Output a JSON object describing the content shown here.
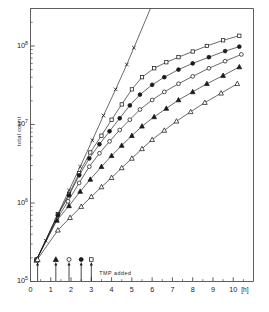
{
  "chart_data": {
    "type": "line",
    "title": "",
    "xlabel": "[h]",
    "ylabel": "total count",
    "yscale": "log",
    "ylim": [
      100000,
      300000000
    ],
    "xlim": [
      0,
      11
    ],
    "xticks": [
      "0",
      "1",
      "2",
      "3",
      "4",
      "5",
      "6",
      "7",
      "8",
      "9",
      "10"
    ],
    "xtick_values": [
      0,
      1,
      2,
      3,
      4,
      5,
      6,
      7,
      8,
      9,
      10
    ],
    "yticks": [
      "10",
      "10",
      "10",
      "10"
    ],
    "ytick_exponents": [
      "5",
      "6",
      "7",
      "8"
    ],
    "ytick_values": [
      100000,
      1000000,
      10000000,
      100000000
    ],
    "grid": false,
    "legend_position": "none",
    "annotation": "TMP added",
    "series": [
      {
        "name": "control",
        "marker": "cross",
        "filled": false,
        "tmp_time": null,
        "points": [
          {
            "x": 0.3,
            "y": 190000
          },
          {
            "x": 0.75,
            "y": 330000
          },
          {
            "x": 1.35,
            "y": 720000
          },
          {
            "x": 1.9,
            "y": 1450000
          },
          {
            "x": 2.45,
            "y": 2900000
          },
          {
            "x": 3.05,
            "y": 6300000
          },
          {
            "x": 3.6,
            "y": 13000000
          },
          {
            "x": 4.2,
            "y": 28000000
          },
          {
            "x": 4.75,
            "y": 58000000
          },
          {
            "x": 5.1,
            "y": 95000000
          }
        ]
      },
      {
        "name": "TMP added at 3.0 h",
        "marker": "square",
        "filled": false,
        "tmp_time": 3.0,
        "points": [
          {
            "x": 0.3,
            "y": 190000
          },
          {
            "x": 1.35,
            "y": 720000
          },
          {
            "x": 1.9,
            "y": 1300000
          },
          {
            "x": 2.4,
            "y": 2400000
          },
          {
            "x": 2.95,
            "y": 4400000
          },
          {
            "x": 3.5,
            "y": 7200000
          },
          {
            "x": 4.0,
            "y": 11500000
          },
          {
            "x": 4.5,
            "y": 18000000
          },
          {
            "x": 5.0,
            "y": 28000000
          },
          {
            "x": 5.5,
            "y": 40000000
          },
          {
            "x": 6.1,
            "y": 52000000
          },
          {
            "x": 6.7,
            "y": 62000000
          },
          {
            "x": 7.3,
            "y": 72000000
          },
          {
            "x": 8.0,
            "y": 85000000
          },
          {
            "x": 8.7,
            "y": 100000000
          },
          {
            "x": 9.5,
            "y": 118000000
          },
          {
            "x": 10.3,
            "y": 135000000
          }
        ]
      },
      {
        "name": "TMP added at 2.5 h",
        "marker": "circle",
        "filled": true,
        "tmp_time": 2.5,
        "points": [
          {
            "x": 0.3,
            "y": 190000
          },
          {
            "x": 1.35,
            "y": 700000
          },
          {
            "x": 1.9,
            "y": 1250000
          },
          {
            "x": 2.4,
            "y": 2250000
          },
          {
            "x": 2.9,
            "y": 3700000
          },
          {
            "x": 3.4,
            "y": 5600000
          },
          {
            "x": 3.9,
            "y": 8200000
          },
          {
            "x": 4.4,
            "y": 12000000
          },
          {
            "x": 4.9,
            "y": 17500000
          },
          {
            "x": 5.4,
            "y": 24000000
          },
          {
            "x": 6.0,
            "y": 32000000
          },
          {
            "x": 6.6,
            "y": 40000000
          },
          {
            "x": 7.3,
            "y": 50000000
          },
          {
            "x": 8.0,
            "y": 60000000
          },
          {
            "x": 8.8,
            "y": 72000000
          },
          {
            "x": 9.6,
            "y": 86000000
          },
          {
            "x": 10.3,
            "y": 98000000
          }
        ]
      },
      {
        "name": "TMP added at 1.9 h",
        "marker": "circle",
        "filled": false,
        "tmp_time": 1.9,
        "points": [
          {
            "x": 0.3,
            "y": 190000
          },
          {
            "x": 1.3,
            "y": 620000
          },
          {
            "x": 1.85,
            "y": 1050000
          },
          {
            "x": 2.4,
            "y": 1800000
          },
          {
            "x": 2.9,
            "y": 2900000
          },
          {
            "x": 3.4,
            "y": 4300000
          },
          {
            "x": 3.9,
            "y": 6100000
          },
          {
            "x": 4.4,
            "y": 8500000
          },
          {
            "x": 4.9,
            "y": 11500000
          },
          {
            "x": 5.4,
            "y": 15500000
          },
          {
            "x": 6.0,
            "y": 20500000
          },
          {
            "x": 6.6,
            "y": 26000000
          },
          {
            "x": 7.3,
            "y": 33000000
          },
          {
            "x": 8.0,
            "y": 41000000
          },
          {
            "x": 8.8,
            "y": 52000000
          },
          {
            "x": 9.6,
            "y": 64000000
          },
          {
            "x": 10.4,
            "y": 78000000
          }
        ]
      },
      {
        "name": "TMP added at 1.25 h",
        "marker": "triangle",
        "filled": true,
        "tmp_time": 1.25,
        "points": [
          {
            "x": 0.3,
            "y": 190000
          },
          {
            "x": 1.3,
            "y": 600000
          },
          {
            "x": 1.9,
            "y": 920000
          },
          {
            "x": 2.45,
            "y": 1400000
          },
          {
            "x": 2.95,
            "y": 2000000
          },
          {
            "x": 3.5,
            "y": 2900000
          },
          {
            "x": 4.0,
            "y": 4000000
          },
          {
            "x": 4.5,
            "y": 5400000
          },
          {
            "x": 5.0,
            "y": 7200000
          },
          {
            "x": 5.5,
            "y": 9500000
          },
          {
            "x": 6.1,
            "y": 12500000
          },
          {
            "x": 6.7,
            "y": 16000000
          },
          {
            "x": 7.3,
            "y": 20500000
          },
          {
            "x": 8.0,
            "y": 26000000
          },
          {
            "x": 8.7,
            "y": 33000000
          },
          {
            "x": 9.5,
            "y": 42000000
          },
          {
            "x": 10.3,
            "y": 54000000
          }
        ]
      },
      {
        "name": "TMP added at 0.35 h",
        "marker": "triangle",
        "filled": false,
        "tmp_time": 0.35,
        "points": [
          {
            "x": 0.3,
            "y": 185000
          },
          {
            "x": 1.35,
            "y": 450000
          },
          {
            "x": 1.95,
            "y": 650000
          },
          {
            "x": 2.5,
            "y": 900000
          },
          {
            "x": 3.0,
            "y": 1200000
          },
          {
            "x": 3.5,
            "y": 1600000
          },
          {
            "x": 4.0,
            "y": 2100000
          },
          {
            "x": 4.5,
            "y": 2800000
          },
          {
            "x": 5.0,
            "y": 3700000
          },
          {
            "x": 5.5,
            "y": 4900000
          },
          {
            "x": 6.0,
            "y": 6400000
          },
          {
            "x": 6.6,
            "y": 8400000
          },
          {
            "x": 7.2,
            "y": 11000000
          },
          {
            "x": 7.9,
            "y": 14500000
          },
          {
            "x": 8.6,
            "y": 19000000
          },
          {
            "x": 9.4,
            "y": 25000000
          },
          {
            "x": 10.2,
            "y": 33000000
          }
        ]
      }
    ],
    "tmp_arrows": [
      {
        "x": 0.35,
        "marker": "triangle",
        "filled": false
      },
      {
        "x": 1.25,
        "marker": "triangle",
        "filled": true
      },
      {
        "x": 1.9,
        "marker": "circle",
        "filled": false
      },
      {
        "x": 2.5,
        "marker": "circle",
        "filled": true
      },
      {
        "x": 3.0,
        "marker": "square",
        "filled": false
      }
    ],
    "colors": {
      "line": "#1a1a1a",
      "axis": "#4d4d4d",
      "background": "#ffffff"
    }
  }
}
